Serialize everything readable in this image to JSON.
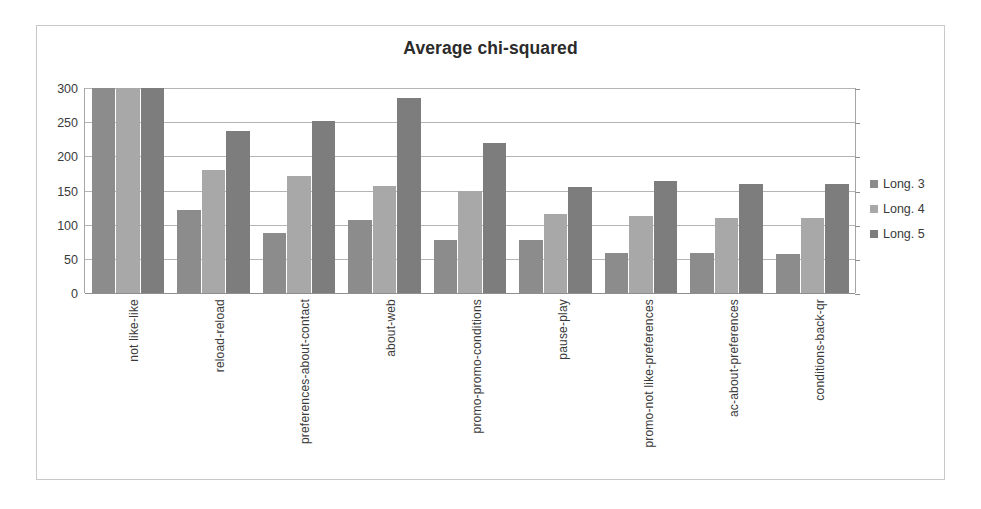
{
  "chart_data": {
    "type": "bar",
    "title": "Average chi-squared",
    "xlabel": "",
    "ylabel": "",
    "ylim": [
      0,
      300
    ],
    "yticks": [
      0,
      50,
      100,
      150,
      200,
      250,
      300
    ],
    "ytick_labels": [
      "0",
      "50",
      "100",
      "150",
      "200",
      "250",
      "300"
    ],
    "grid": true,
    "legend_position": "right",
    "categories": [
      "not like-like",
      "reload-reload",
      "preferences-about-contact",
      "about-web",
      "promo-promo-conditions",
      "pause-play",
      "promo-not like-preferences",
      "ac-about-preferences",
      "conditions-back-qr"
    ],
    "series": [
      {
        "name": "Long. 3",
        "color": "#8c8c8c",
        "values": [
          300,
          122,
          88,
          107,
          78,
          78,
          58,
          58,
          57
        ]
      },
      {
        "name": "Long. 4",
        "color": "#a8a8a8",
        "values": [
          300,
          180,
          171,
          157,
          149,
          116,
          113,
          110,
          110
        ]
      },
      {
        "name": "Long. 5",
        "color": "#7d7d7d",
        "values": [
          300,
          237,
          251,
          286,
          219,
          155,
          164,
          160,
          159
        ]
      }
    ],
    "note_clipped": "Series values in the first category reach or exceed the axis maximum of 300."
  },
  "colors": {
    "frame_border": "#c9c9c9",
    "gridline": "#b5b5b5",
    "axis": "#8f8f8f",
    "text": "#3a3a3a",
    "title": "#2b2b2b",
    "background": "#ffffff"
  }
}
